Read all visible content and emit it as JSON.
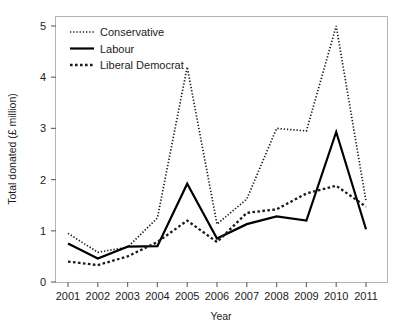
{
  "figure": {
    "top_partial_text": "",
    "background_color": "#ffffff",
    "frame_color": "#b4b4b4"
  },
  "chart_data": {
    "type": "line",
    "title": "",
    "xlabel": "Year",
    "ylabel": "Total donated (£ million)",
    "x": [
      "2001",
      "2002",
      "2003",
      "2004",
      "2005",
      "2006",
      "2007",
      "2008",
      "2009",
      "2010",
      "2011"
    ],
    "categories": [
      "2001",
      "2002",
      "2003",
      "2004",
      "2005",
      "2006",
      "2007",
      "2008",
      "2009",
      "2010",
      "2011"
    ],
    "xlim": [
      2001,
      2011
    ],
    "ylim": [
      0,
      5.2
    ],
    "yticks": [
      0,
      1,
      2,
      3,
      4,
      5
    ],
    "ytick_labels": [
      "0",
      "1",
      "2",
      "3",
      "4",
      "5"
    ],
    "xticks": [
      "2001",
      "2002",
      "2003",
      "2004",
      "2005",
      "2006",
      "2007",
      "2008",
      "2009",
      "2010",
      "2011"
    ],
    "grid": false,
    "legend_position": "top-left",
    "series": [
      {
        "name": "Conservative",
        "style": "fine-dotted",
        "color": "#1b1b1b",
        "values": [
          0.95,
          0.58,
          0.68,
          1.25,
          4.2,
          1.13,
          1.62,
          3.0,
          2.95,
          5.0,
          1.58
        ]
      },
      {
        "name": "Labour",
        "style": "solid",
        "color": "#000000",
        "values": [
          0.75,
          0.46,
          0.69,
          0.7,
          1.92,
          0.85,
          1.13,
          1.28,
          1.2,
          2.93,
          1.03
        ]
      },
      {
        "name": "Liberal Democrat",
        "style": "coarse-dotted",
        "color": "#1b1b1b",
        "values": [
          0.4,
          0.33,
          0.5,
          0.78,
          1.2,
          0.78,
          1.35,
          1.42,
          1.73,
          1.88,
          1.47
        ]
      }
    ]
  },
  "legend": {
    "items": [
      {
        "label": "Conservative"
      },
      {
        "label": "Labour"
      },
      {
        "label": "Liberal Democrat"
      }
    ]
  }
}
